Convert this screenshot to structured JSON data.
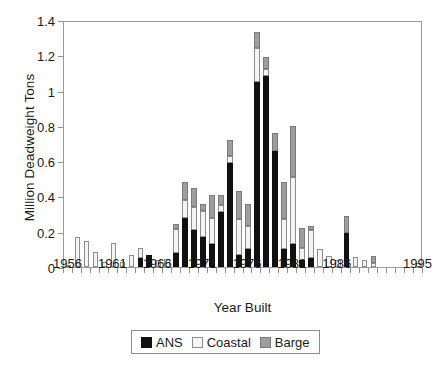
{
  "chart_data": {
    "type": "bar",
    "subtype": "stacked-bar",
    "title": "",
    "xlabel": "Year Built",
    "ylabel": "Million Deadweight Tons",
    "ylim": [
      0,
      1.4
    ],
    "ytick_values": [
      0,
      0.2,
      0.4,
      0.6,
      0.8,
      1,
      1.2,
      1.4
    ],
    "ytick_labels": [
      "0",
      "0.2",
      "0.4",
      "0.6",
      "0.8",
      "1",
      "1.2",
      "1.4"
    ],
    "grid": false,
    "legend_position": "bottom-center",
    "xtick_labels": [
      "1956",
      "1961",
      "1966",
      "1971",
      "1976",
      "1981",
      "1986",
      "1995"
    ],
    "xtick_categories": [
      "1956",
      "1961",
      "1966",
      "1971",
      "1976",
      "1981",
      "1986",
      "1995"
    ],
    "categories": [
      "1956",
      "1957",
      "1958",
      "1959",
      "1960",
      "1961",
      "1962",
      "1963",
      "1964",
      "1965",
      "1966",
      "1967",
      "1968",
      "1969",
      "1970",
      "1971",
      "1972",
      "1973",
      "1974",
      "1975",
      "1976",
      "1977",
      "1978",
      "1979",
      "1980",
      "1981",
      "1982",
      "1983",
      "1984",
      "1985",
      "1986",
      "1987",
      "1988",
      "1989",
      "1990",
      "1991",
      "1992",
      "1993",
      "1994",
      "1995"
    ],
    "series": [
      {
        "name": "ANS",
        "color": "#111111",
        "values": [
          0,
          0,
          0,
          0,
          0,
          0,
          0,
          0,
          0.05,
          0.07,
          0,
          0,
          0.08,
          0.28,
          0.21,
          0.17,
          0.13,
          0.31,
          0.59,
          0.07,
          0.1,
          1.05,
          1.08,
          0.66,
          0.1,
          0.13,
          0.04,
          0.05,
          0,
          0,
          0,
          0.19,
          0,
          0,
          0,
          0,
          0,
          0,
          0,
          0
        ]
      },
      {
        "name": "Coastal",
        "color": "#f4f4f4",
        "values": [
          0.01,
          0.17,
          0.145,
          0.085,
          0.03,
          0.135,
          0.03,
          0.07,
          0.055,
          0,
          0.04,
          0.045,
          0.135,
          0.1,
          0.13,
          0.15,
          0.15,
          0.04,
          0.04,
          0.2,
          0.13,
          0.19,
          0.04,
          0,
          0.17,
          0.38,
          0.07,
          0.16,
          0.1,
          0.065,
          0.04,
          0,
          0.055,
          0.04,
          0.025,
          0,
          0,
          0,
          0,
          0.02
        ]
      },
      {
        "name": "Barge",
        "color": "#9e9e9e",
        "values": [
          0,
          0,
          0,
          0,
          0,
          0,
          0,
          0,
          0,
          0,
          0,
          0,
          0.03,
          0.1,
          0.11,
          0.04,
          0.13,
          0.06,
          0.09,
          0.16,
          0.13,
          0.09,
          0.07,
          0.1,
          0.21,
          0.29,
          0.11,
          0.02,
          0,
          0,
          0,
          0.1,
          0,
          0,
          0.035,
          0,
          0,
          0,
          0,
          0
        ]
      }
    ],
    "totals": [
      0.01,
      0.17,
      0.145,
      0.085,
      0.03,
      0.135,
      0.03,
      0.07,
      0.105,
      0.07,
      0.04,
      0.045,
      0.245,
      0.48,
      0.45,
      0.36,
      0.41,
      0.41,
      0.72,
      0.43,
      0.36,
      1.33,
      1.19,
      0.76,
      0.48,
      0.8,
      0.22,
      0.23,
      0.1,
      0.065,
      0.04,
      0.29,
      0.055,
      0.04,
      0.06,
      0,
      0,
      0,
      0,
      0.02
    ]
  },
  "legend": {
    "items": [
      {
        "label": "ANS",
        "swatch": "swatch-ans"
      },
      {
        "label": "Coastal",
        "swatch": "swatch-coastal"
      },
      {
        "label": "Barge",
        "swatch": "swatch-barge"
      }
    ]
  }
}
